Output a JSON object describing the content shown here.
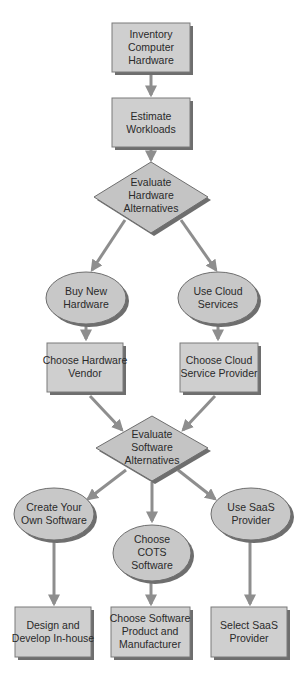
{
  "diagram": {
    "type": "flowchart",
    "colors": {
      "node_fill": "#cfcfcf",
      "node_stroke": "#7a7a7a",
      "edge": "#8e8e8e",
      "text": "#2a2a2a",
      "background": "#ffffff"
    },
    "nodes": {
      "inventory": {
        "shape": "rectangle",
        "lines": [
          "Inventory",
          "Computer",
          "Hardware"
        ]
      },
      "estimate": {
        "shape": "rectangle",
        "lines": [
          "Estimate",
          "Workloads"
        ]
      },
      "eval_hw": {
        "shape": "diamond",
        "lines": [
          "Evaluate",
          "Hardware",
          "Alternatives"
        ]
      },
      "buy_new": {
        "shape": "ellipse",
        "lines": [
          "Buy New",
          "Hardware"
        ]
      },
      "use_cloud": {
        "shape": "ellipse",
        "lines": [
          "Use Cloud",
          "Services"
        ]
      },
      "choose_hw_vendor": {
        "shape": "rectangle",
        "lines": [
          "Choose Hardware",
          "Vendor"
        ]
      },
      "choose_cloud_provider": {
        "shape": "rectangle",
        "lines": [
          "Choose Cloud",
          "Service Provider"
        ]
      },
      "eval_sw": {
        "shape": "diamond",
        "lines": [
          "Evaluate",
          "Software",
          "Alternatives"
        ]
      },
      "create_own": {
        "shape": "ellipse",
        "lines": [
          "Create Your",
          "Own Software"
        ]
      },
      "choose_cots": {
        "shape": "ellipse",
        "lines": [
          "Choose",
          "COTS",
          "Software"
        ]
      },
      "use_saas": {
        "shape": "ellipse",
        "lines": [
          "Use SaaS",
          "Provider"
        ]
      },
      "design_develop": {
        "shape": "rectangle",
        "lines": [
          "Design and",
          "Develop In-house"
        ]
      },
      "choose_sw_product": {
        "shape": "rectangle",
        "lines": [
          "Choose Software",
          "Product and",
          "Manufacturer"
        ]
      },
      "select_saas": {
        "shape": "rectangle",
        "lines": [
          "Select SaaS",
          "Provider"
        ]
      }
    },
    "edges": [
      [
        "inventory",
        "estimate"
      ],
      [
        "estimate",
        "eval_hw"
      ],
      [
        "eval_hw",
        "buy_new"
      ],
      [
        "eval_hw",
        "use_cloud"
      ],
      [
        "buy_new",
        "choose_hw_vendor"
      ],
      [
        "use_cloud",
        "choose_cloud_provider"
      ],
      [
        "choose_hw_vendor",
        "eval_sw"
      ],
      [
        "choose_cloud_provider",
        "eval_sw"
      ],
      [
        "eval_sw",
        "create_own"
      ],
      [
        "eval_sw",
        "choose_cots"
      ],
      [
        "eval_sw",
        "use_saas"
      ],
      [
        "create_own",
        "design_develop"
      ],
      [
        "choose_cots",
        "choose_sw_product"
      ],
      [
        "use_saas",
        "select_saas"
      ]
    ]
  }
}
